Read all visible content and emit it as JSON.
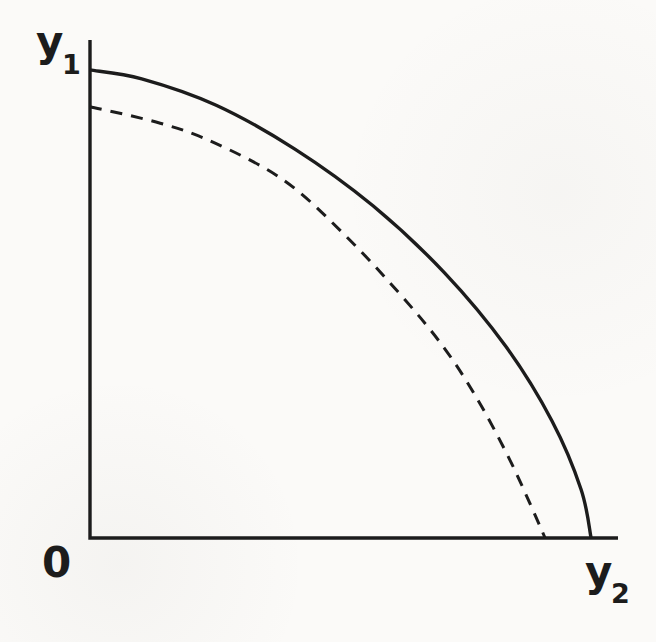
{
  "figure": {
    "ink_color": "#1c1c1c",
    "paper_color": "#fbfaf8",
    "origin_label": "0"
  },
  "chart_data": {
    "type": "line",
    "title": "",
    "grid": false,
    "legend": "none",
    "x_axis": {
      "label_base": "y",
      "label_sub": "2",
      "range": [
        0,
        1
      ],
      "ticks": []
    },
    "y_axis": {
      "label_base": "y",
      "label_sub": "1",
      "range": [
        0,
        1
      ],
      "ticks": []
    },
    "series": [
      {
        "name": "outer-frontier",
        "line_style": "solid",
        "x_intercept": 0.949,
        "y_intercept": 0.94,
        "points": [
          [
            0.0,
            0.94
          ],
          [
            0.098,
            0.922
          ],
          [
            0.239,
            0.869
          ],
          [
            0.388,
            0.781
          ],
          [
            0.536,
            0.667
          ],
          [
            0.672,
            0.532
          ],
          [
            0.788,
            0.384
          ],
          [
            0.875,
            0.235
          ],
          [
            0.93,
            0.098
          ],
          [
            0.949,
            0.0
          ]
        ]
      },
      {
        "name": "inner-frontier",
        "line_style": "dashed",
        "x_intercept": 0.862,
        "y_intercept": 0.866,
        "points": [
          [
            0.0,
            0.866
          ],
          [
            0.133,
            0.833
          ],
          [
            0.237,
            0.793
          ],
          [
            0.369,
            0.717
          ],
          [
            0.483,
            0.608
          ],
          [
            0.587,
            0.49
          ],
          [
            0.672,
            0.38
          ],
          [
            0.739,
            0.269
          ],
          [
            0.795,
            0.157
          ],
          [
            0.833,
            0.07
          ],
          [
            0.862,
            0.0
          ]
        ]
      }
    ]
  }
}
